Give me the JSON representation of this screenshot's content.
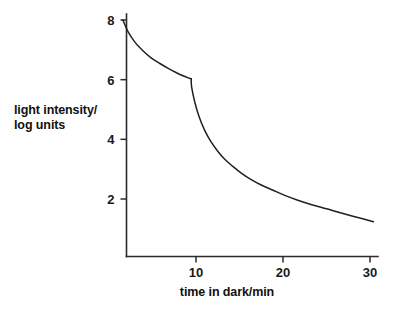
{
  "chart_data": {
    "type": "line",
    "title": "",
    "xlabel": "time in dark/min",
    "ylabel_line1": "light intensity/",
    "ylabel_line2": "log units",
    "xlim": [
      0,
      31.5
    ],
    "ylim": [
      0.2,
      8.6
    ],
    "grid": false,
    "legend": null,
    "xticks": [
      10,
      20,
      30
    ],
    "xtick_labels": [
      "10",
      "20",
      "30"
    ],
    "yticks": [
      2,
      4,
      6,
      8
    ],
    "ytick_labels": [
      "2",
      "4",
      "6",
      "8"
    ],
    "annotations": [],
    "series": [
      {
        "name": "dark adaptation",
        "color": "#231f20",
        "x": [
          1.6,
          2.2,
          3.0,
          3.9,
          4.8,
          5.8,
          6.8,
          7.7,
          8.5,
          9.1,
          9.45,
          9.5,
          9.9,
          10.4,
          11.0,
          11.7,
          12.5,
          13.3,
          14.2,
          15.2,
          16.3,
          17.5,
          18.8,
          20.2,
          21.7,
          23.3,
          25.0,
          26.8,
          28.6,
          30.4
        ],
        "y": [
          8.0,
          7.6,
          7.25,
          6.97,
          6.74,
          6.55,
          6.38,
          6.24,
          6.13,
          6.06,
          6.03,
          5.75,
          5.2,
          4.72,
          4.3,
          3.93,
          3.6,
          3.33,
          3.1,
          2.87,
          2.66,
          2.47,
          2.3,
          2.12,
          1.96,
          1.81,
          1.67,
          1.52,
          1.38,
          1.24
        ]
      }
    ]
  },
  "axes": {
    "x_axis_name": "x-axis",
    "y_axis_name": "y-axis"
  }
}
